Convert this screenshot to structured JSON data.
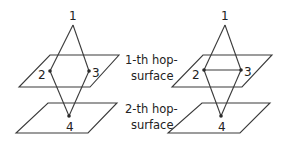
{
  "diagram": {
    "left": {
      "nodes": [
        {
          "id": "1",
          "label": "1"
        },
        {
          "id": "2",
          "label": "2"
        },
        {
          "id": "3",
          "label": "3"
        },
        {
          "id": "4",
          "label": "4"
        }
      ],
      "edges": [
        [
          "1",
          "2"
        ],
        [
          "1",
          "3"
        ],
        [
          "2",
          "4"
        ],
        [
          "3",
          "4"
        ]
      ]
    },
    "right": {
      "nodes": [
        {
          "id": "1",
          "label": "1"
        },
        {
          "id": "2",
          "label": "2"
        },
        {
          "id": "3",
          "label": "3"
        },
        {
          "id": "4",
          "label": "4"
        }
      ],
      "edges": [
        [
          "1",
          "2"
        ],
        [
          "1",
          "3"
        ],
        [
          "2",
          "4"
        ],
        [
          "3",
          "4"
        ],
        [
          "2",
          "3"
        ]
      ]
    },
    "surfaces": [
      {
        "line1": "1-th hop-",
        "line2": "surface"
      },
      {
        "line1": "2-th hop-",
        "line2": "surface"
      }
    ]
  }
}
